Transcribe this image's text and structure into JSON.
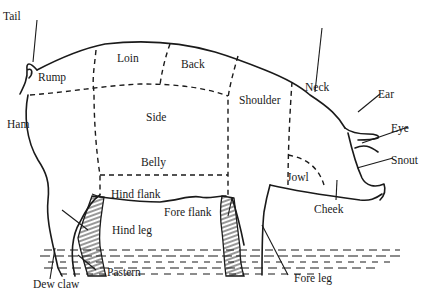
{
  "diagram": {
    "labels": {
      "tail": "Tail",
      "rump": "Rump",
      "loin": "Loin",
      "back": "Back",
      "neck": "Neck",
      "ear": "Ear",
      "eye": "Eye",
      "snout": "Snout",
      "ham": "Ham",
      "side": "Side",
      "shoulder": "Shoulder",
      "belly": "Belly",
      "jowl": "Jowl",
      "cheek": "Cheek",
      "hind_flank": "Hind flank",
      "fore_flank": "Fore flank",
      "hind_leg": "Hind leg",
      "fore_leg": "Fore leg",
      "pastern": "Pastern",
      "dew_claw": "Dew claw"
    },
    "colors": {
      "ink": "#1a1a1a",
      "background": "#ffffff"
    }
  }
}
